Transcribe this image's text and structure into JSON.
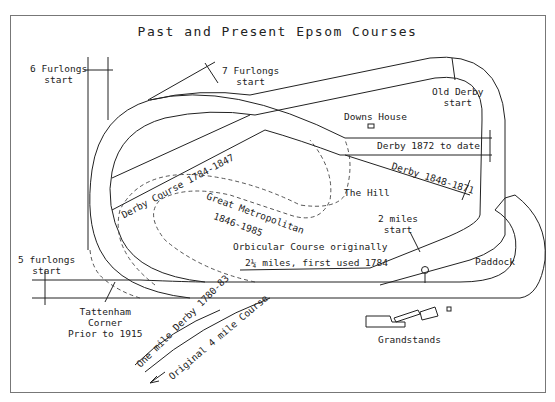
{
  "title": "Past and Present Epsom Courses",
  "labels": {
    "six_furlongs": "6 Furlongs\nstart",
    "seven_furlongs": "7 Furlongs\nstart",
    "old_derby": "Old Derby\nstart",
    "downs_house": "Downs House",
    "derby_1872": "Derby 1872 to date",
    "derby_1848": "Derby 1848-1871",
    "derby_course": "Derby Course 1784-1847",
    "great_metropolitan": "Great Metropolitan",
    "great_metropolitan_years": "1846-1985",
    "the_hill": "The Hill",
    "two_miles": "2 miles\nstart",
    "orbicular_1": "Orbicular Course originally",
    "orbicular_2": "2¼ miles, first used 1784",
    "paddock": "Paddock",
    "five_furlongs": "5 furlongs\nstart",
    "tattenham": "Tattenham\nCorner\nPrior to 1915",
    "one_mile_derby": "One mile Derby 1780-83",
    "original_4_mile": "Original 4 mile Course",
    "grandstands": "Grandstands"
  },
  "colors": {
    "line": "#222222",
    "frame": "#777777",
    "background": "#ffffff"
  }
}
